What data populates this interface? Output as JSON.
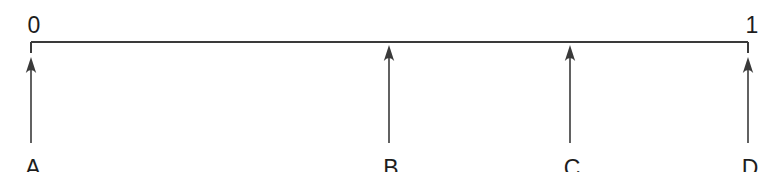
{
  "figure": {
    "width": 778,
    "height": 172,
    "background_color": "#ffffff",
    "line_color": "#3a3a3a",
    "text_color": "#1d1d1d"
  },
  "axis": {
    "type": "number-line",
    "start_label": "0",
    "end_label": "1",
    "start_value": 0,
    "end_value": 1,
    "line_y": 42,
    "x_start": 31,
    "x_end": 748,
    "tick_drop": 11
  },
  "markers": [
    {
      "label": "A",
      "x": 31,
      "value": 0.0,
      "tip_y": 57,
      "tail_y": 143,
      "label_y": 157
    },
    {
      "label": "B",
      "x": 389,
      "value": 0.5,
      "tip_y": 45,
      "tail_y": 143,
      "label_y": 157
    },
    {
      "label": "C",
      "x": 570,
      "value": 0.75,
      "tip_y": 45,
      "tail_y": 143,
      "label_y": 157
    },
    {
      "label": "D",
      "x": 748,
      "value": 1.0,
      "tip_y": 57,
      "tail_y": 143,
      "label_y": 157
    }
  ],
  "chart_data": {
    "type": "scatter",
    "title": "",
    "xlabel": "",
    "ylabel": "",
    "xlim": [
      0,
      1
    ],
    "grid": false,
    "legend": false,
    "categories": [
      "A",
      "B",
      "C",
      "D"
    ],
    "values": [
      0.0,
      0.5,
      0.75,
      1.0
    ],
    "tick_labels": [
      "0",
      "1"
    ],
    "tick_values": [
      0,
      1
    ],
    "annotations": [
      "0 marks the left end of the number line",
      "1 marks the right end of the number line",
      "Arrows A, B, C, D point upward to positions on the line"
    ]
  }
}
